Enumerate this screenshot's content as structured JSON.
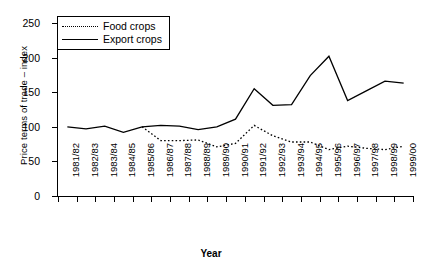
{
  "chart_data": {
    "type": "line",
    "title": "",
    "xlabel": "Year",
    "ylabel": "Price terms of trade – index",
    "ylim": [
      0,
      250
    ],
    "yticks": [
      0,
      50,
      100,
      150,
      200,
      250
    ],
    "grid": false,
    "legend_position": "top-left",
    "categories": [
      "1981/82",
      "1982/83",
      "1983/84",
      "1984/85",
      "1985/86",
      "1986/87",
      "1987/88",
      "1988/89",
      "1989/90",
      "1990/91",
      "1991/92",
      "1992/93",
      "1993/94",
      "1994/95",
      "1995/96",
      "1996/97",
      "1997/98",
      "1998/99",
      "1999/00"
    ],
    "series": [
      {
        "name": "Food crops",
        "marker": "diamond",
        "linestyle": "dotted",
        "color": "#000000",
        "values": [
          null,
          null,
          null,
          null,
          100,
          80,
          80,
          81,
          71,
          76,
          102,
          87,
          78,
          78,
          67,
          72,
          69,
          67,
          72
        ]
      },
      {
        "name": "Export crops",
        "marker": "square",
        "linestyle": "solid",
        "color": "#000000",
        "values": [
          100,
          97,
          101,
          92,
          100,
          102,
          101,
          96,
          100,
          111,
          155,
          131,
          132,
          174,
          202,
          138,
          152,
          166,
          163
        ]
      }
    ]
  },
  "legend": {
    "items": [
      {
        "label": "Food crops",
        "marker": "diamond-marker",
        "line": "dotted"
      },
      {
        "label": "Export crops",
        "marker": "square-marker",
        "line": "solid"
      }
    ]
  }
}
